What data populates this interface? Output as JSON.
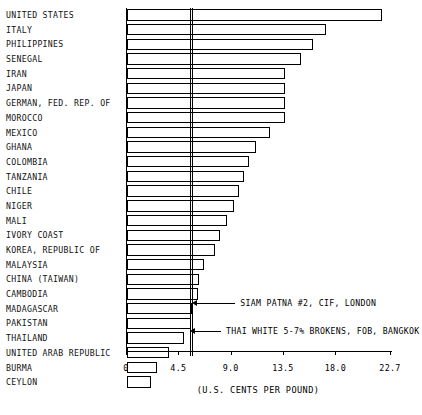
{
  "chart_data": {
    "type": "bar",
    "orientation": "horizontal",
    "title": "",
    "xlabel": "(U.S. CENTS PER POUND)",
    "ylabel": "",
    "xlim": [
      0,
      22.7
    ],
    "grid": false,
    "legend": "none",
    "tick_labels": [
      "0",
      "4.5",
      "9.0",
      "13.5",
      "18.0",
      "22.7"
    ],
    "tick_values": [
      0,
      4.5,
      9.0,
      13.5,
      18.0,
      22.7
    ],
    "categories": [
      "UNITED STATES",
      "ITALY",
      "PHILIPPINES",
      "SENEGAL",
      "IRAN",
      "JAPAN",
      "GERMAN, FED. REP. OF",
      "MOROCCO",
      "MEXICO",
      "GHANA",
      "COLOMBIA",
      "TANZANIA",
      "CHILE",
      "NIGER",
      "MALI",
      "IVORY COAST",
      "KOREA, REPUBLIC OF",
      "MALAYSIA",
      "CHINA (TAIWAN)",
      "CAMBODIA",
      "MADAGASCAR",
      "PAKISTAN",
      "THAILAND",
      "UNITED ARAB REPUBLIC",
      "BURMA",
      "CEYLON"
    ],
    "values": [
      21.9,
      17.1,
      16.0,
      15.0,
      13.6,
      13.6,
      13.6,
      13.6,
      12.3,
      11.1,
      10.5,
      10.1,
      9.6,
      9.2,
      8.6,
      8.0,
      7.6,
      6.6,
      6.2,
      6.1,
      5.6,
      5.5,
      4.9,
      3.6,
      2.6,
      2.1
    ],
    "annotations": [
      {
        "label": "SIAM PATNA #2, CIF, LONDON",
        "value": 5.7
      },
      {
        "label": "THAI WHITE 5-7% BROKENS, FOB, BANGKOK",
        "value": 5.5
      }
    ],
    "reference_lines": [
      5.5,
      5.7
    ]
  }
}
